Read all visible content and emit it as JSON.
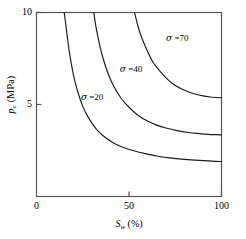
{
  "chart_data": {
    "type": "line",
    "title": "",
    "xlabel": "S_w (%)",
    "ylabel": "p_c (MPa)",
    "xlabel_parts": {
      "main": "S",
      "sub": "w",
      "unit": "(%)"
    },
    "ylabel_parts": {
      "main": "p",
      "sub": "c",
      "unit": "(MPa)"
    },
    "xlim": [
      0,
      100
    ],
    "ylim": [
      0,
      10
    ],
    "xticks": [
      "0",
      "50",
      "100"
    ],
    "xtick_values": [
      0,
      50,
      100
    ],
    "yticks": [
      "5",
      "10"
    ],
    "ytick_values": [
      5,
      10
    ],
    "grid": false,
    "legend_position": "inline-annotations",
    "line_color": "#1a1a1a",
    "frame_color": "#4d4d4d",
    "series": [
      {
        "name": "sigma = 20",
        "label": "σ =20",
        "sigma": 20,
        "x": [
          15,
          16,
          17,
          18,
          20,
          22,
          25,
          28,
          32,
          36,
          41,
          46,
          52,
          58,
          65,
          72,
          80,
          88,
          95,
          100
        ],
        "y": [
          10.0,
          9.2,
          8.4,
          7.7,
          6.6,
          5.8,
          4.9,
          4.3,
          3.7,
          3.3,
          2.95,
          2.7,
          2.5,
          2.35,
          2.2,
          2.1,
          2.02,
          1.96,
          1.92,
          1.9
        ]
      },
      {
        "name": "sigma = 40",
        "label": "σ =40",
        "sigma": 40,
        "x": [
          31,
          32,
          34,
          36,
          39,
          42,
          46,
          50,
          55,
          60,
          65,
          70,
          76,
          82,
          88,
          93,
          97,
          100
        ],
        "y": [
          10.0,
          9.3,
          8.3,
          7.5,
          6.6,
          5.95,
          5.3,
          4.85,
          4.4,
          4.1,
          3.88,
          3.72,
          3.58,
          3.48,
          3.42,
          3.38,
          3.36,
          3.35
        ]
      },
      {
        "name": "sigma = 70",
        "label": "σ =70",
        "sigma": 70,
        "x": [
          53,
          55,
          57,
          60,
          63,
          66,
          70,
          74,
          78,
          82,
          86,
          90,
          94,
          97,
          100
        ],
        "y": [
          10.0,
          9.2,
          8.6,
          7.9,
          7.3,
          6.9,
          6.45,
          6.1,
          5.87,
          5.69,
          5.56,
          5.47,
          5.41,
          5.38,
          5.36
        ]
      }
    ],
    "annotations": [
      {
        "text": "σ =70",
        "x_pct": 70,
        "y_val": 8.55
      },
      {
        "text": "σ =40",
        "x_pct": 45,
        "y_val": 6.85
      },
      {
        "text": "σ =20",
        "x_pct": 24,
        "y_val": 5.35
      }
    ]
  }
}
